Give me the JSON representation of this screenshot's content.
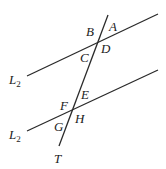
{
  "diagram": {
    "line_color": "#2a2a2a",
    "lines": [
      {
        "id": "top-line",
        "label": "L",
        "subscript": "2",
        "x1": 27,
        "y1": 76,
        "x2": 158,
        "y2": 14
      },
      {
        "id": "bottom-line",
        "label": "L",
        "subscript": "2",
        "x1": 27,
        "y1": 131,
        "x2": 158,
        "y2": 70
      },
      {
        "id": "transversal",
        "label": "T",
        "x1": 108,
        "y1": 15,
        "x2": 59,
        "y2": 146
      }
    ],
    "angle_labels": {
      "A": "A",
      "B": "B",
      "C": "C",
      "D": "D",
      "E": "E",
      "F": "F",
      "G": "G",
      "H": "H"
    },
    "line_labels": {
      "top": "L",
      "top_sub": "2",
      "bottom": "L",
      "bottom_sub": "2",
      "transversal": "T"
    }
  }
}
